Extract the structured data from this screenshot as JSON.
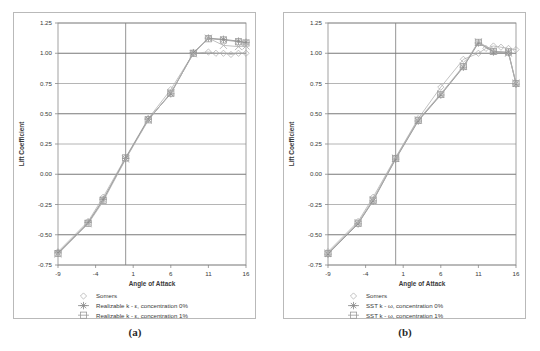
{
  "figure": {
    "panels": [
      {
        "caption": "(a)",
        "name": "panel-a",
        "chart_data": {
          "type": "line",
          "title": "",
          "xlabel": "Angle of Attack",
          "ylabel": "Lift Coefficient",
          "xlim": [
            -9,
            16
          ],
          "ylim": [
            -0.75,
            1.25
          ],
          "xticks": [
            "-9",
            "-4",
            "1",
            "6",
            "11",
            "16"
          ],
          "xtick_values": [
            -9,
            -4,
            1,
            6,
            11,
            16
          ],
          "yticks": [
            "-0.75",
            "-0.50",
            "-0.25",
            "0.00",
            "0.25",
            "0.50",
            "0.75",
            "1.00",
            "1.25"
          ],
          "ytick_values": [
            -0.75,
            -0.5,
            -0.25,
            0,
            0.25,
            0.5,
            0.75,
            1,
            1.25
          ],
          "grid": true,
          "legend_position": "bottom",
          "series": [
            {
              "name": "Somers",
              "marker": "diamond",
              "color": "#a8a8a8",
              "x": [
                -9,
                -5,
                -3,
                0,
                3,
                6,
                9,
                11,
                12,
                13,
                14,
                15,
                16
              ],
              "y": [
                -0.64,
                -0.39,
                -0.19,
                0.14,
                0.46,
                0.7,
                1.0,
                1.01,
                1.0,
                1.0,
                0.99,
                1.0,
                1.0
              ]
            },
            {
              "name": "Realizable k - ε, concentration 0%",
              "marker": "asterisk",
              "color": "#8c8c8c",
              "x": [
                -9,
                -5,
                -3,
                0,
                3,
                6,
                9,
                11,
                13,
                15,
                16
              ],
              "y": [
                -0.65,
                -0.4,
                -0.21,
                0.13,
                0.455,
                0.665,
                1.005,
                1.125,
                1.115,
                1.1,
                1.09
              ]
            },
            {
              "name": "Realizable k - ε, concentration 1%",
              "marker": "square",
              "color": "#9a9a9a",
              "x": [
                -9,
                -5,
                -3,
                0,
                3,
                6,
                9,
                11,
                13,
                15,
                16
              ],
              "y": [
                -0.655,
                -0.405,
                -0.215,
                0.135,
                0.45,
                0.67,
                1.0,
                1.12,
                1.11,
                1.095,
                1.085
              ]
            },
            {
              "name": "Realizable k - ε, concentration 10%",
              "marker": "cross",
              "color": "#b0b0b0",
              "x": [
                -9,
                -5,
                -3,
                0,
                3,
                6,
                9,
                11,
                13,
                15,
                16
              ],
              "y": [
                -0.66,
                -0.41,
                -0.225,
                0.125,
                0.445,
                0.675,
                0.995,
                1.125,
                1.065,
                1.055,
                1.06
              ]
            }
          ]
        }
      },
      {
        "caption": "(b)",
        "name": "panel-b",
        "chart_data": {
          "type": "line",
          "title": "",
          "xlabel": "Angle of Attack",
          "ylabel": "Lift Coefficient",
          "xlim": [
            -9,
            16
          ],
          "ylim": [
            -0.75,
            1.25
          ],
          "xticks": [
            "-9",
            "-4",
            "1",
            "6",
            "11",
            "16"
          ],
          "xtick_values": [
            -9,
            -4,
            1,
            6,
            11,
            16
          ],
          "yticks": [
            "-0.75",
            "-0.50",
            "-0.25",
            "0.00",
            "0.25",
            "0.50",
            "0.75",
            "1.00",
            "1.25"
          ],
          "ytick_values": [
            -0.75,
            -0.5,
            -0.25,
            0,
            0.25,
            0.5,
            0.75,
            1,
            1.25
          ],
          "grid": true,
          "legend_position": "bottom",
          "series": [
            {
              "name": "Somers",
              "marker": "diamond",
              "color": "#a8a8a8",
              "x": [
                -9,
                -5,
                -3,
                0,
                3,
                6,
                9,
                11,
                12,
                13,
                14,
                15,
                16
              ],
              "y": [
                -0.64,
                -0.39,
                -0.19,
                0.14,
                0.46,
                0.72,
                0.95,
                1.0,
                1.04,
                1.06,
                1.05,
                1.04,
                1.03
              ]
            },
            {
              "name": "SST k - ω, concentration 0%",
              "marker": "asterisk",
              "color": "#8c8c8c",
              "x": [
                -9,
                -5,
                -3,
                0,
                3,
                6,
                9,
                11,
                13,
                15,
                16
              ],
              "y": [
                -0.66,
                -0.41,
                -0.22,
                0.125,
                0.44,
                0.655,
                0.885,
                1.085,
                1.01,
                1.005,
                0.745
              ]
            },
            {
              "name": "SST k - ω, concentration 1%",
              "marker": "square",
              "color": "#9a9a9a",
              "x": [
                -9,
                -5,
                -3,
                0,
                3,
                6,
                9,
                11,
                13,
                15,
                16
              ],
              "y": [
                -0.655,
                -0.405,
                -0.215,
                0.13,
                0.445,
                0.66,
                0.89,
                1.09,
                1.015,
                1.01,
                0.75
              ]
            },
            {
              "name": "SST k - ω, concentration 10%",
              "marker": "cross",
              "color": "#b0b0b0",
              "x": [
                -9,
                -5,
                -3,
                0,
                3,
                6,
                9,
                11,
                13,
                15,
                16
              ],
              "y": [
                -0.65,
                -0.4,
                -0.21,
                0.135,
                0.45,
                0.665,
                0.895,
                1.095,
                1.02,
                1.0,
                0.755
              ]
            }
          ]
        }
      }
    ]
  }
}
